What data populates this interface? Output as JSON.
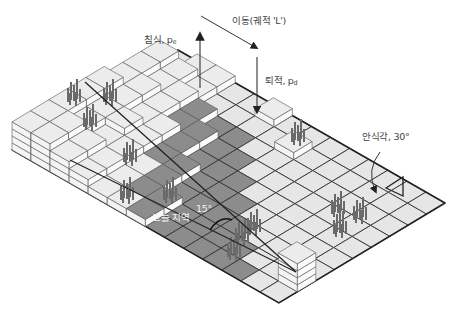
{
  "diagram": {
    "type": "isometric landscape evolution cellular model",
    "grid": {
      "cols_right": 14,
      "rows_left": 9
    },
    "colors": {
      "light_cell": "#e6e6e6",
      "dark_cell": "#8c8c8c",
      "block_top": "#ececec",
      "block_side": "#f7f7f7",
      "line": "#333333",
      "tree": "#6a6a6a"
    },
    "labels": {
      "erosion": "침식, p",
      "erosion_sub": "e",
      "transport": "이동(궤적 'L')",
      "deposition": "퇴적, p",
      "deposition_sub": "d",
      "repose_angle": "안식각, 30°",
      "shadow_zone": "그늘 지역",
      "shadow_angle": "15°"
    }
  }
}
